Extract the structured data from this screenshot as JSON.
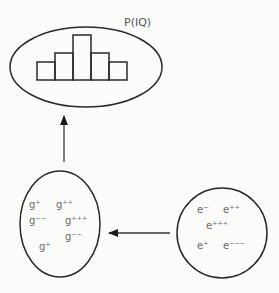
{
  "top_node": {
    "title": "P(IQ)",
    "histogram": {
      "bars": [
        {
          "x": 37,
          "top": 62
        },
        {
          "x": 55,
          "top": 53
        },
        {
          "x": 73,
          "top": 35
        },
        {
          "x": 91,
          "top": 53
        },
        {
          "x": 109,
          "top": 62
        }
      ],
      "bar_width": 18,
      "baseline": 80
    }
  },
  "left_node": {
    "labels": [
      {
        "text": "g⁺",
        "x": 29,
        "y": 208
      },
      {
        "text": "g⁺⁺",
        "x": 56,
        "y": 208
      },
      {
        "text": "g⁻⁻",
        "x": 29,
        "y": 224
      },
      {
        "text": "g⁺⁺⁺",
        "x": 65,
        "y": 224
      },
      {
        "text": "g⁻⁻",
        "x": 65,
        "y": 240
      },
      {
        "text": "g⁺",
        "x": 39,
        "y": 250
      }
    ]
  },
  "right_node": {
    "labels": [
      {
        "text": "e⁻",
        "x": 197,
        "y": 213
      },
      {
        "text": "e⁺⁺",
        "x": 223,
        "y": 213
      },
      {
        "text": "e⁺⁺⁺",
        "x": 206,
        "y": 229
      },
      {
        "text": "e⁺",
        "x": 197,
        "y": 249
      },
      {
        "text": "e⁻⁻⁻",
        "x": 223,
        "y": 249
      }
    ]
  }
}
